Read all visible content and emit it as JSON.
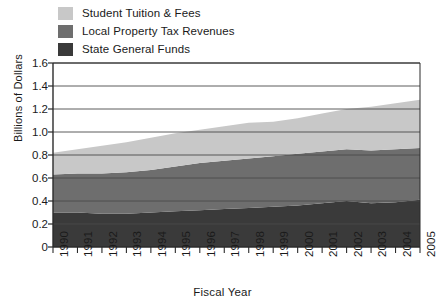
{
  "chart_data": {
    "type": "area",
    "title": "",
    "xlabel": "Fiscal Year",
    "ylabel": "Billions of Dollars",
    "categories": [
      "1990",
      "1991",
      "1992",
      "1993",
      "1994",
      "1995",
      "1996",
      "1997",
      "1998",
      "1999",
      "2000",
      "2001",
      "2002",
      "2003",
      "2004",
      "2005"
    ],
    "series": [
      {
        "name": "State  General  Funds",
        "color": "#3a3a3a",
        "values": [
          0.3,
          0.3,
          0.29,
          0.29,
          0.3,
          0.31,
          0.32,
          0.33,
          0.34,
          0.35,
          0.36,
          0.38,
          0.4,
          0.38,
          0.39,
          0.41
        ]
      },
      {
        "name": "Local Property Tax Revenues",
        "color": "#6e6e6e",
        "values": [
          0.33,
          0.34,
          0.35,
          0.36,
          0.37,
          0.39,
          0.41,
          0.42,
          0.43,
          0.44,
          0.45,
          0.45,
          0.45,
          0.46,
          0.46,
          0.45
        ]
      },
      {
        "name": "Student Tuition & Fees",
        "color": "#c8c8c8",
        "values": [
          0.19,
          0.21,
          0.24,
          0.26,
          0.28,
          0.29,
          0.29,
          0.3,
          0.31,
          0.3,
          0.31,
          0.33,
          0.35,
          0.38,
          0.4,
          0.42
        ]
      }
    ],
    "totals": [
      0.82,
      0.85,
      0.88,
      0.91,
      0.95,
      0.99,
      1.02,
      1.05,
      1.08,
      1.09,
      1.12,
      1.16,
      1.2,
      1.22,
      1.25,
      1.28
    ],
    "yticks": [
      "0",
      "0.2",
      "0.4",
      "0.6",
      "0.8",
      "1.0",
      "1.2",
      "1.4",
      "1.6"
    ],
    "ylim": [
      0,
      1.6
    ],
    "grid": true,
    "legend_position": "top-left",
    "stacked": true,
    "stack_order_bottom_to_top": [
      "State  General  Funds",
      "Local Property Tax Revenues",
      "Student Tuition & Fees"
    ]
  },
  "legend": {
    "items": [
      {
        "label": "Student Tuition & Fees",
        "color": "#c8c8c8"
      },
      {
        "label": "Local Property Tax Revenues",
        "color": "#6e6e6e"
      },
      {
        "label": "State  General  Funds",
        "color": "#3a3a3a"
      }
    ]
  },
  "axes": {
    "x_title": "Fiscal Year",
    "y_title": "Billions of Dollars",
    "y_labels": [
      "1.6",
      "1.4",
      "1.2",
      "1.0",
      "0.8",
      "0.6",
      "0.4",
      "0.2",
      "0"
    ],
    "x_labels": [
      "1990",
      "1991",
      "1992",
      "1993",
      "1994",
      "1995",
      "1996",
      "1997",
      "1998",
      "1999",
      "2000",
      "2001",
      "2002",
      "2003",
      "2004",
      "2005"
    ]
  },
  "colors": {
    "axis": "#2b2b2b",
    "grid": "#4a4a4a",
    "text": "#1a1a1a",
    "background": "#ffffff"
  }
}
